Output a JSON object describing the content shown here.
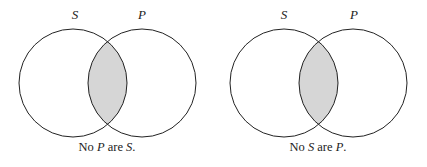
{
  "diagrams": [
    {
      "left_label": "S",
      "right_label": "P",
      "shaded_region": "intersection",
      "caption": {
        "w1": "No ",
        "v1": "P",
        "w2": " are ",
        "v2": "S",
        "w3": "."
      }
    },
    {
      "left_label": "S",
      "right_label": "P",
      "shaded_region": "intersection",
      "caption": {
        "w1": "No ",
        "v1": "S",
        "w2": " are ",
        "v2": "P",
        "w3": "."
      }
    }
  ],
  "colors": {
    "shade": "#d6d6d6",
    "stroke": "#222222"
  }
}
